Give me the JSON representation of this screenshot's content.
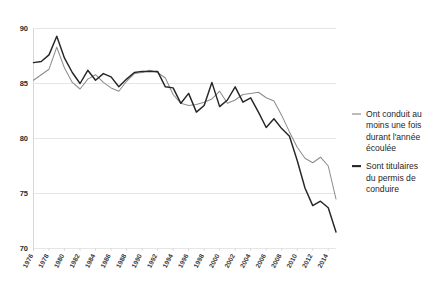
{
  "chart_data": {
    "type": "line",
    "title": "",
    "subtitle": "",
    "xlabel": "",
    "ylabel": "",
    "ylim": [
      70,
      90
    ],
    "xlim": [
      1976,
      2015
    ],
    "grid": true,
    "legend_position": "right",
    "yticks": [
      70,
      75,
      80,
      85,
      90
    ],
    "xticks": [
      1976,
      1978,
      1980,
      1982,
      1984,
      1986,
      1988,
      1990,
      1992,
      1994,
      1996,
      1998,
      2000,
      2002,
      2004,
      2006,
      2008,
      2010,
      2012,
      2014
    ],
    "x": [
      1976,
      1977,
      1978,
      1979,
      1980,
      1981,
      1982,
      1983,
      1984,
      1985,
      1986,
      1987,
      1988,
      1989,
      1990,
      1991,
      1992,
      1993,
      1994,
      1995,
      1996,
      1997,
      1998,
      1999,
      2000,
      2001,
      2002,
      2003,
      2004,
      2005,
      2006,
      2007,
      2008,
      2009,
      2010,
      2011,
      2012,
      2013,
      2014,
      2015
    ],
    "series": [
      {
        "name": "Ont conduit au moins une fois durant l'année écoulée",
        "color": "#8d8d8d",
        "values": [
          85.3,
          85.8,
          86.3,
          88.3,
          86.4,
          85.1,
          84.5,
          85.4,
          85.8,
          85.1,
          84.6,
          84.3,
          85.2,
          85.9,
          86.0,
          86.2,
          86.0,
          85.5,
          84.0,
          83.2,
          83.0,
          83.1,
          83.3,
          83.6,
          84.3,
          83.2,
          83.5,
          84.0,
          84.1,
          84.2,
          83.7,
          83.4,
          82.1,
          80.6,
          79.2,
          78.2,
          77.8,
          78.3,
          77.5,
          74.5
        ]
      },
      {
        "name": "Sont titulaires du permis de conduire",
        "color": "#262626",
        "values": [
          86.9,
          87.0,
          87.6,
          89.3,
          87.3,
          86.0,
          85.0,
          86.2,
          85.3,
          85.9,
          85.6,
          84.7,
          85.4,
          86.0,
          86.1,
          86.1,
          86.1,
          84.7,
          84.6,
          83.2,
          84.1,
          82.4,
          83.0,
          85.1,
          82.9,
          83.5,
          84.7,
          83.3,
          83.7,
          82.4,
          81.0,
          81.8,
          80.9,
          80.2,
          78.0,
          75.5,
          73.9,
          74.3,
          73.7,
          71.5
        ]
      }
    ]
  },
  "legend": {
    "items": [
      {
        "id": "conduit",
        "swatch": "gray-line-swatch",
        "lines": [
          "Ont conduit au",
          "moins une fois",
          "durant l'année",
          "écoulée"
        ]
      },
      {
        "id": "titulaires",
        "swatch": "black-line-swatch",
        "lines": [
          "Sont titulaires",
          "du permis de",
          "conduire"
        ]
      }
    ]
  },
  "axis": {
    "y_labels": [
      "90",
      "85",
      "80",
      "75",
      "70"
    ],
    "x_labels": [
      "1976",
      "1978",
      "1980",
      "1982",
      "1984",
      "1986",
      "1988",
      "1990",
      "1992",
      "1994",
      "1996",
      "1998",
      "2000",
      "2002",
      "2004",
      "2006",
      "2008",
      "2010",
      "2012",
      "2014"
    ]
  }
}
